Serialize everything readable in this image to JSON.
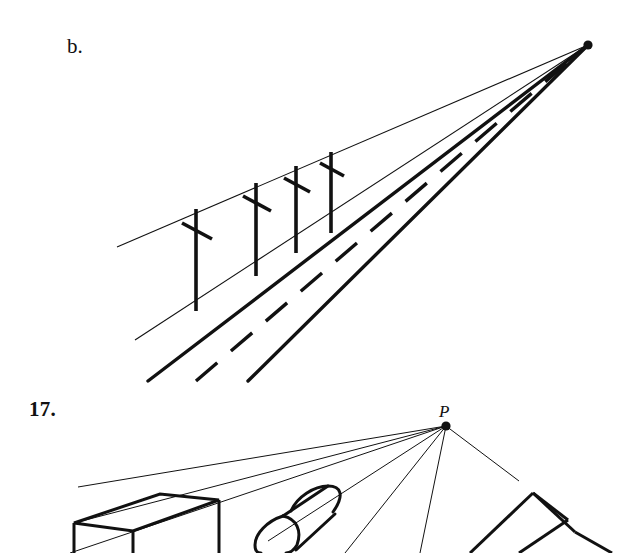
{
  "page": {
    "background_color": "#ffffff",
    "ink_color": "#111111",
    "width": 631,
    "height": 553
  },
  "figures": [
    {
      "id": "figure-b",
      "label": "b.",
      "label_pos": {
        "x": 67,
        "y": 36
      },
      "caption": "One-point perspective drawing of a road with telephone poles converging to a vanishing point",
      "vanishing_point": {
        "x": 588,
        "y": 45,
        "radius": 4.5,
        "labeled": false
      },
      "converging_lines": [
        {
          "name": "pole-top-guideline",
          "from": {
            "x": 117,
            "y": 247
          },
          "to": {
            "x": 588,
            "y": 45
          },
          "weight": "thin"
        },
        {
          "name": "pole-base-guideline",
          "from": {
            "x": 135,
            "y": 340
          },
          "to": {
            "x": 588,
            "y": 45
          },
          "weight": "thin"
        },
        {
          "name": "road-left-edge",
          "from": {
            "x": 148,
            "y": 381
          },
          "to": {
            "x": 588,
            "y": 45
          },
          "weight": "thick"
        },
        {
          "name": "road-center-dashed",
          "from": {
            "x": 196,
            "y": 381
          },
          "to": {
            "x": 588,
            "y": 45
          },
          "weight": "thick",
          "dashed": true
        },
        {
          "name": "road-right-edge",
          "from": {
            "x": 248,
            "y": 381
          },
          "to": {
            "x": 588,
            "y": 45
          },
          "weight": "thick"
        }
      ],
      "poles": [
        {
          "name": "pole-1",
          "x": 196,
          "top_y": 211,
          "bottom_y": 310,
          "crossbar_y": 229,
          "crossbar_half": 14
        },
        {
          "name": "pole-2",
          "x": 256,
          "top_y": 185,
          "bottom_y": 275,
          "crossbar_y": 203,
          "crossbar_half": 13
        },
        {
          "name": "pole-3",
          "x": 296,
          "top_y": 168,
          "bottom_y": 252,
          "crossbar_y": 186,
          "crossbar_half": 12
        },
        {
          "name": "pole-4",
          "x": 331,
          "top_y": 153,
          "bottom_y": 232,
          "crossbar_y": 171,
          "crossbar_half": 11
        }
      ]
    },
    {
      "id": "figure-17",
      "label": "17.",
      "label_pos": {
        "x": 29,
        "y": 399
      },
      "caption": "One-point perspective drawing of a rectangular box, a cylinder and a triangular prism all converging to point P",
      "vanishing_point": {
        "x": 446,
        "y": 426,
        "radius": 4.5,
        "labeled": true,
        "point_label": "P"
      },
      "solids": [
        {
          "name": "rectangular-box",
          "type": "box"
        },
        {
          "name": "cylinder",
          "type": "cylinder"
        },
        {
          "name": "triangular-prism",
          "type": "prism"
        }
      ]
    }
  ]
}
